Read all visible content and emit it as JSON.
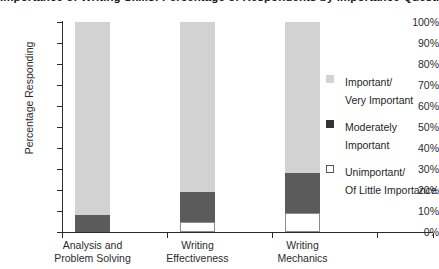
{
  "chart_data": {
    "type": "bar",
    "title": "Importance of Writing Skills: Percentage of Respondents by Importance Question",
    "xlabel": "",
    "ylabel": "Percentage Responding",
    "ylim": [
      0,
      100
    ],
    "ytick_labels": [
      "0%",
      "10%",
      "20%",
      "30%",
      "40%",
      "50%",
      "60%",
      "70%",
      "80%",
      "90%",
      "100%"
    ],
    "ytick_values": [
      0,
      10,
      20,
      30,
      40,
      50,
      60,
      70,
      80,
      90,
      100
    ],
    "grid": false,
    "stacked": true,
    "legend_position": "right",
    "categories": [
      "Analysis and\nProblem Solving",
      "Writing\nEffectiveness",
      "Writing\nMechanics"
    ],
    "series": [
      {
        "name": "Unimportant/\nOf Little Importance",
        "color": "#ffffff",
        "values": [
          0,
          5,
          9
        ]
      },
      {
        "name": "Moderately\nImportant",
        "color": "#5b5b5b",
        "values": [
          8,
          14,
          19
        ]
      },
      {
        "name": "Important/\nVery Important",
        "color": "#d2d2d2",
        "values": [
          92,
          81,
          72
        ]
      }
    ]
  },
  "legend": {
    "items": [
      {
        "label": "Important/\nVery Important"
      },
      {
        "label": "Moderately\nImportant"
      },
      {
        "label": "Unimportant/\nOf Little Importance"
      }
    ]
  }
}
